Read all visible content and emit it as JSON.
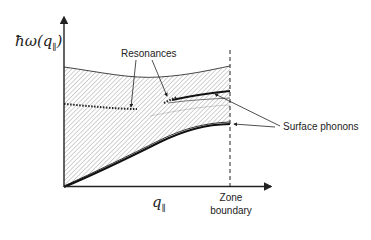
{
  "diagram": {
    "type": "phonon-dispersion-schematic",
    "y_axis": {
      "symbol": "ħω(q",
      "subscript": "∥",
      "close": ")"
    },
    "x_axis": {
      "symbol": "q",
      "subscript": "∥"
    },
    "zone_boundary": {
      "line1": "Zone",
      "line2": "boundary"
    },
    "annotations": {
      "resonances": "Resonances",
      "surface_phonons": "Surface phonons"
    },
    "regions": {
      "bulk_band": "hatched",
      "surface_branches": 2,
      "resonance_branches": 2
    },
    "colors": {
      "line": "#222222",
      "hatch": "#9a9a9a",
      "background": "#ffffff"
    }
  }
}
